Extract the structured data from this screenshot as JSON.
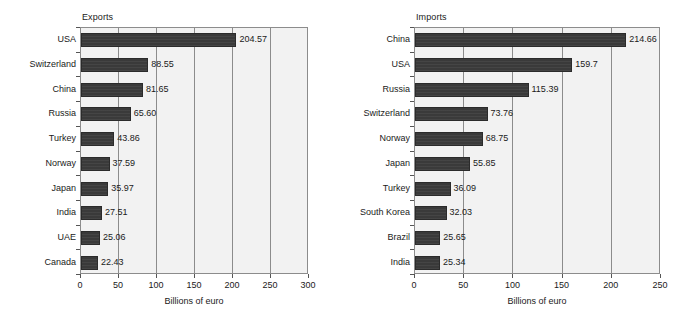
{
  "figure": {
    "background_color": "#ffffff",
    "bar_color": "#3a3a3a",
    "plot_background_color": "#f2f2f2",
    "axis_color": "#8c8c8c"
  },
  "chart_data": [
    {
      "type": "bar",
      "orientation": "horizontal",
      "title": "Exports",
      "xlabel": "Billions of euro",
      "ylabel": "",
      "xlim": [
        0,
        300
      ],
      "xticks": [
        0,
        50,
        100,
        150,
        200,
        250,
        300
      ],
      "xtick_labels": [
        "0",
        "50",
        "100",
        "150",
        "200",
        "250",
        "300"
      ],
      "grid": true,
      "legend": false,
      "categories": [
        "USA",
        "Switzerland",
        "China",
        "Russia",
        "Turkey",
        "Norway",
        "Japan",
        "India",
        "UAE",
        "Canada"
      ],
      "values": [
        204.57,
        88.55,
        81.65,
        65.6,
        43.86,
        37.59,
        35.97,
        27.51,
        25.06,
        22.43
      ],
      "data_labels": [
        "204.57",
        "88.55",
        "81.65",
        "65.60",
        "43.86",
        "37.59",
        "35.97",
        "27.51",
        "25.06",
        "22.43"
      ]
    },
    {
      "type": "bar",
      "orientation": "horizontal",
      "title": "Imports",
      "xlabel": "Billions of euro",
      "ylabel": "",
      "xlim": [
        0,
        250
      ],
      "xticks": [
        0,
        50,
        100,
        150,
        200,
        250
      ],
      "xtick_labels": [
        "0",
        "50",
        "100",
        "150",
        "200",
        "250"
      ],
      "grid": true,
      "legend": false,
      "categories": [
        "China",
        "USA",
        "Russia",
        "Switzerland",
        "Norway",
        "Japan",
        "Turkey",
        "South Korea",
        "Brazil",
        "India"
      ],
      "values": [
        214.66,
        159.7,
        115.39,
        73.76,
        68.75,
        55.85,
        36.09,
        32.03,
        25.65,
        25.34
      ],
      "data_labels": [
        "214.66",
        "159.7",
        "115.39",
        "73.76",
        "68.75",
        "55.85",
        "36.09",
        "32.03",
        "25.65",
        "25.34"
      ]
    }
  ]
}
